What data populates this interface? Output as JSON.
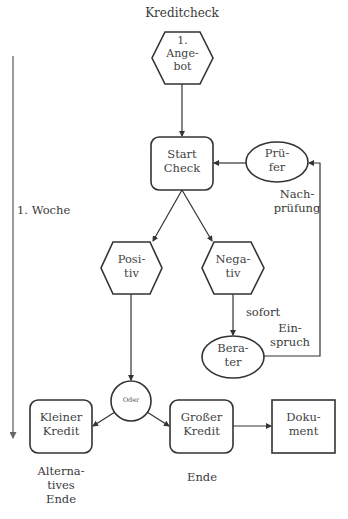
{
  "title": "Kreditcheck",
  "timeline": {
    "label": "1. Woche"
  },
  "nodes": {
    "angebot": {
      "shape": "hexagon",
      "label": "1.\nAnge-\nbot"
    },
    "start_check": {
      "shape": "rounded-rect",
      "label": "Start\nCheck"
    },
    "pruefer": {
      "shape": "ellipse",
      "label": "Prü-\nfer"
    },
    "positiv": {
      "shape": "hexagon",
      "label": "Posi-\ntiv"
    },
    "negativ": {
      "shape": "hexagon",
      "label": "Nega-\ntiv"
    },
    "berater": {
      "shape": "ellipse",
      "label": "Bera-\nter"
    },
    "oder": {
      "shape": "circle",
      "label": "Oder"
    },
    "kleiner_kredit": {
      "shape": "rounded-rect",
      "label": "Kleiner\nKredit"
    },
    "grosser_kredit": {
      "shape": "rounded-rect",
      "label": "Großer\nKredit"
    },
    "dokument": {
      "shape": "rect",
      "label": "Doku-\nment"
    }
  },
  "annotations": {
    "nachpruefung": "Nach-\nprüfung",
    "sofort": "sofort",
    "einspruch": "Ein-\nspruch",
    "alternatives_ende": "Alterna-\ntives\nEnde",
    "ende": "Ende"
  },
  "edges": [
    {
      "from": "angebot",
      "to": "start_check"
    },
    {
      "from": "start_check",
      "to": "positiv"
    },
    {
      "from": "start_check",
      "to": "negativ"
    },
    {
      "from": "negativ",
      "to": "berater",
      "label": "sofort"
    },
    {
      "from": "berater",
      "to": "pruefer",
      "label": "Einspruch"
    },
    {
      "from": "pruefer",
      "to": "start_check",
      "label": "Nachprüfung"
    },
    {
      "from": "positiv",
      "to": "oder"
    },
    {
      "from": "oder",
      "to": "kleiner_kredit"
    },
    {
      "from": "oder",
      "to": "grosser_kredit"
    },
    {
      "from": "grosser_kredit",
      "to": "dokument"
    }
  ],
  "colors": {
    "stroke": "#333333",
    "text": "#444444",
    "timeline": "#666666"
  }
}
